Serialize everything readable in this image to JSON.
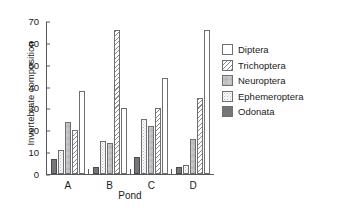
{
  "chart_data": {
    "type": "bar",
    "title": "",
    "xlabel": "Pond",
    "ylabel": "Invertebrate composition",
    "categories": [
      "A",
      "B",
      "C",
      "D"
    ],
    "ylim": [
      0,
      70
    ],
    "yticks": [
      0,
      10,
      20,
      30,
      40,
      50,
      60,
      70
    ],
    "grid": false,
    "legend_position": "right",
    "series": [
      {
        "name": "Odonata",
        "values": [
          7,
          3,
          8,
          3
        ],
        "fill": "fill-solid",
        "color": "#76767a"
      },
      {
        "name": "Ephemeroptera",
        "values": [
          11,
          15,
          25,
          4
        ],
        "fill": "fill-dots-light",
        "color": "#fdfdfd"
      },
      {
        "name": "Neuroptera",
        "values": [
          24,
          14,
          22,
          16
        ],
        "fill": "fill-dots-dense",
        "color": "#e9e9eb"
      },
      {
        "name": "Trichoptera",
        "values": [
          20,
          66,
          30,
          35
        ],
        "fill": "fill-hatch",
        "color": "#fefefe"
      },
      {
        "name": "Diptera",
        "values": [
          38,
          30,
          44,
          66
        ],
        "fill": "fill-white",
        "color": "#ffffff"
      }
    ],
    "legend_order": [
      "Diptera",
      "Trichoptera",
      "Neuroptera",
      "Ephemeroptera",
      "Odonata"
    ]
  },
  "legend": {
    "items": [
      {
        "label": "Diptera",
        "fill": "fill-white"
      },
      {
        "label": "Trichoptera",
        "fill": "fill-hatch"
      },
      {
        "label": "Neuroptera",
        "fill": "fill-dots-dense"
      },
      {
        "label": "Ephemeroptera",
        "fill": "fill-dots-light"
      },
      {
        "label": "Odonata",
        "fill": "fill-solid"
      }
    ]
  }
}
